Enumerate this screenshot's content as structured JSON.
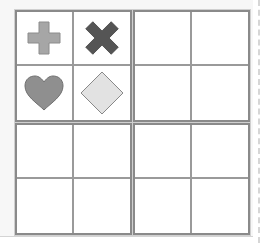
{
  "puzzle": {
    "type": "symbol-grid",
    "layout": "2x2 boxes of 2x2 cells",
    "boxes": [
      {
        "id": "top-left",
        "cells": [
          {
            "symbol": "plus",
            "color": "#a6a6a6",
            "stroke": "#8c8c8c"
          },
          {
            "symbol": "cross",
            "color": "#555555",
            "stroke": "#444444"
          },
          {
            "symbol": "heart",
            "color": "#8f8f8f",
            "stroke": "#6f6f6f"
          },
          {
            "symbol": "diamond",
            "color": "#e2e2e2",
            "stroke": "#888888"
          }
        ]
      },
      {
        "id": "top-right",
        "cells": [
          {
            "symbol": ""
          },
          {
            "symbol": ""
          },
          {
            "symbol": ""
          },
          {
            "symbol": ""
          }
        ]
      },
      {
        "id": "bottom-left",
        "cells": [
          {
            "symbol": ""
          },
          {
            "symbol": ""
          },
          {
            "symbol": ""
          },
          {
            "symbol": ""
          }
        ]
      },
      {
        "id": "bottom-right",
        "cells": [
          {
            "symbol": ""
          },
          {
            "symbol": ""
          },
          {
            "symbol": ""
          },
          {
            "symbol": ""
          }
        ]
      }
    ]
  },
  "colors": {
    "box_border": "#8a8a8a",
    "cell_divider": "#9a9a9a",
    "page_background": "#f7f7f7",
    "cell_background": "#ffffff"
  }
}
